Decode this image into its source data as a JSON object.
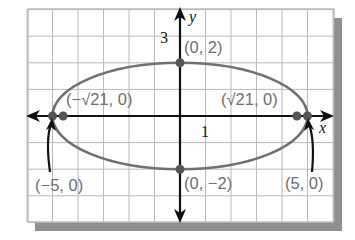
{
  "chart_data": {
    "type": "line",
    "title": "",
    "subtitle": "",
    "equation": "x^2/25 + y^2/4 = 1",
    "xlabel": "x",
    "ylabel": "y",
    "xlim": [
      -6,
      6
    ],
    "ylim": [
      -4,
      4
    ],
    "grid": true,
    "grid_step": 1,
    "legend": null,
    "tick_labels": [
      {
        "axis": "x",
        "value": 1,
        "text": "1"
      },
      {
        "axis": "y",
        "value": 3,
        "text": "3"
      }
    ],
    "series": [
      {
        "name": "ellipse",
        "shape": "ellipse",
        "center": [
          0,
          0
        ],
        "semi_major_axis": 5,
        "semi_minor_axis": 2,
        "orientation": "horizontal",
        "color": "#707070"
      }
    ],
    "points": [
      {
        "id": "vertex-left",
        "x": -5,
        "y": 0,
        "label": "(−5, 0)",
        "marker": "dot"
      },
      {
        "id": "vertex-right",
        "x": 5,
        "y": 0,
        "label": "(5, 0)",
        "marker": "dot"
      },
      {
        "id": "focus-left",
        "x": -4.583,
        "y": 0,
        "label": "(−√21, 0)",
        "marker": "dot"
      },
      {
        "id": "focus-right",
        "x": 4.583,
        "y": 0,
        "label": "(√21, 0)",
        "marker": "dot"
      },
      {
        "id": "covertex-top",
        "x": 0,
        "y": 2,
        "label": "(0, 2)",
        "marker": "dot"
      },
      {
        "id": "covertex-bottom",
        "x": 0,
        "y": -2,
        "label": "(0, −2)",
        "marker": "dot"
      }
    ],
    "annotations": [
      {
        "text": "(−5, 0)",
        "points_to": [
          -5,
          0
        ],
        "style": "curved-arrow"
      },
      {
        "text": "(5, 0)",
        "points_to": [
          5,
          0
        ],
        "style": "curved-arrow"
      }
    ]
  },
  "labels": {
    "x_axis": "x",
    "y_axis": "y",
    "tick_x_1": "1",
    "tick_y_3": "3",
    "covertex_top": "(0, 2)",
    "covertex_bottom": "(0, −2)",
    "focus_left": "(−√21, 0)",
    "focus_right": "(√21, 0)",
    "vertex_left": "(−5, 0)",
    "vertex_right": "(5, 0)"
  },
  "colors": {
    "grid": "#b8b8b8",
    "axis": "#111111",
    "curve": "#707070",
    "point": "#555555",
    "label": "#6e6e6e",
    "shadow": "#8f8f8f"
  }
}
